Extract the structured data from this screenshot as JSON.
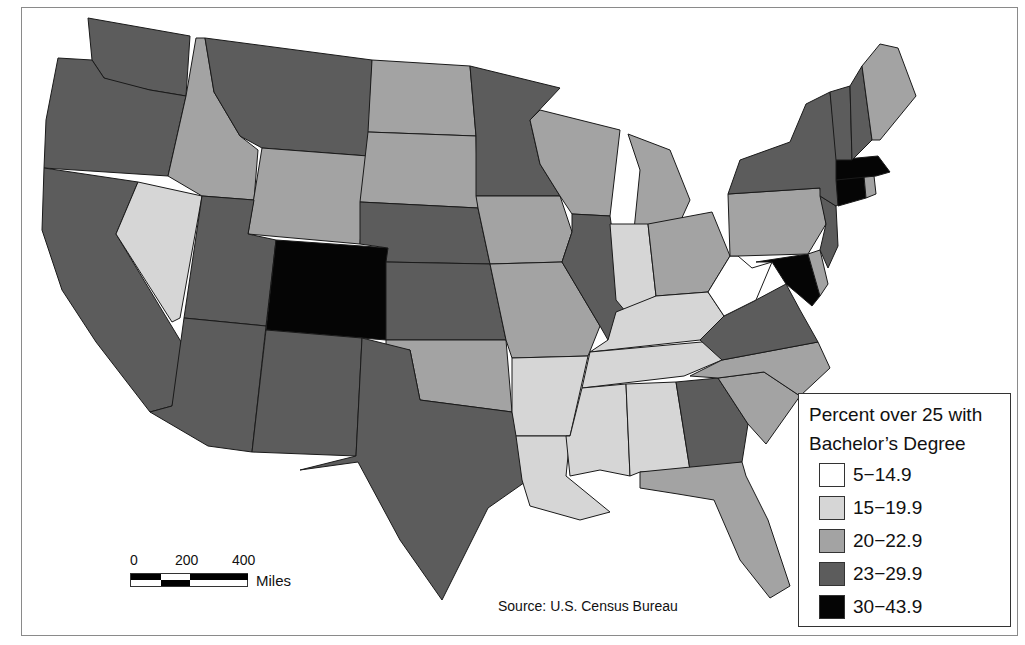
{
  "map": {
    "subject": "Percent of population over 25 with Bachelor's Degree, contiguous United States",
    "source": "Source: U.S. Census Bureau",
    "legend": {
      "title_line1": "Percent over 25 with",
      "title_line2": "Bachelor’s Degree",
      "classes": [
        {
          "label": "5−14.9",
          "color": "#ffffff"
        },
        {
          "label": "15−19.9",
          "color": "#d6d6d6"
        },
        {
          "label": "20−22.9",
          "color": "#a3a3a3"
        },
        {
          "label": "23−29.9",
          "color": "#5c5c5c"
        },
        {
          "label": "30−43.9",
          "color": "#050505"
        }
      ]
    },
    "scale_bar": {
      "ticks": [
        "0",
        "200",
        "400"
      ],
      "unit": "Miles"
    },
    "states": {
      "WA": 3,
      "OR": 3,
      "CA": 3,
      "NV": 1,
      "ID": 2,
      "MT": 3,
      "WY": 2,
      "UT": 3,
      "AZ": 3,
      "CO": 4,
      "NM": 3,
      "ND": 2,
      "SD": 2,
      "NE": 3,
      "KS": 3,
      "OK": 2,
      "TX": 3,
      "MN": 3,
      "IA": 2,
      "MO": 2,
      "AR": 1,
      "LA": 1,
      "WI": 2,
      "IL": 3,
      "MI": 2,
      "IN": 1,
      "OH": 2,
      "KY": 1,
      "TN": 1,
      "MS": 1,
      "AL": 1,
      "GA": 3,
      "FL": 2,
      "SC": 2,
      "NC": 2,
      "VA": 3,
      "WV": 0,
      "MD": 4,
      "DE": 2,
      "PA": 2,
      "NJ": 3,
      "NY": 3,
      "CT": 4,
      "RI": 2,
      "MA": 4,
      "VT": 3,
      "NH": 3,
      "ME": 2
    }
  }
}
